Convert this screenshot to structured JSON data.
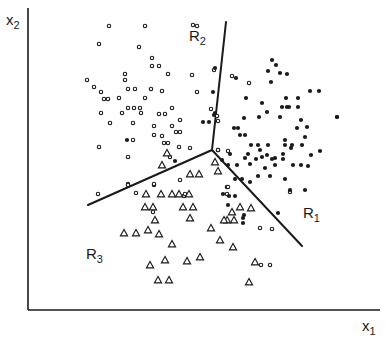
{
  "figure": {
    "y_axis_label": "x",
    "y_axis_sub": "2",
    "x_axis_label": "x",
    "x_axis_sub": "1",
    "regions": [
      {
        "name": "R",
        "sub": "1",
        "x": 303,
        "y": 205
      },
      {
        "name": "R",
        "sub": "2",
        "x": 189,
        "y": 28
      },
      {
        "name": "R",
        "sub": "3",
        "x": 86,
        "y": 246
      }
    ],
    "colors": {
      "ink": "#1a1a1a",
      "background": "#ffffff"
    }
  },
  "chart_data": {
    "type": "scatter",
    "title": "",
    "xlabel": "x1",
    "ylabel": "x2",
    "grid": false,
    "legend": "none",
    "axes_px": {
      "origin": [
        28,
        310
      ],
      "x_end": [
        380,
        310
      ],
      "y_end": [
        28,
        8
      ]
    },
    "boundaries": [
      {
        "name": "R1|R2",
        "from": [
          212,
          150
        ],
        "to": [
          226,
          22
        ]
      },
      {
        "name": "R2|R3",
        "from": [
          212,
          150
        ],
        "to": [
          88,
          205
        ]
      },
      {
        "name": "R1|R3",
        "from": [
          212,
          150
        ],
        "to": [
          302,
          246
        ]
      }
    ],
    "series": [
      {
        "name": "open circles",
        "marker": "open-circle",
        "points": [
          [
            109,
            26
          ],
          [
            145,
            26
          ],
          [
            99,
            44
          ],
          [
            139,
            47
          ],
          [
            152,
            58
          ],
          [
            152,
            66
          ],
          [
            159,
            66
          ],
          [
            125,
            74
          ],
          [
            125,
            80
          ],
          [
            87,
            80
          ],
          [
            94,
            87
          ],
          [
            101,
            92
          ],
          [
            128,
            89
          ],
          [
            135,
            89
          ],
          [
            151,
            89
          ],
          [
            168,
            74
          ],
          [
            104,
            99
          ],
          [
            108,
            99
          ],
          [
            119,
            98
          ],
          [
            162,
            91
          ],
          [
            145,
            98
          ],
          [
            128,
            108
          ],
          [
            134,
            108
          ],
          [
            140,
            108
          ],
          [
            101,
            113
          ],
          [
            122,
            113
          ],
          [
            141,
            113
          ],
          [
            159,
            114
          ],
          [
            165,
            114
          ],
          [
            172,
            108
          ],
          [
            110,
            123
          ],
          [
            133,
            123
          ],
          [
            180,
            120
          ],
          [
            154,
            126
          ],
          [
            172,
            126
          ],
          [
            154,
            135
          ],
          [
            162,
            136
          ],
          [
            176,
            132
          ],
          [
            180,
            132
          ],
          [
            133,
            140
          ],
          [
            164,
            143
          ],
          [
            168,
            143
          ],
          [
            179,
            147
          ],
          [
            190,
            148
          ],
          [
            99,
            147
          ],
          [
            128,
            157
          ],
          [
            193,
            25
          ],
          [
            197,
            26
          ],
          [
            192,
            75
          ],
          [
            197,
            92
          ],
          [
            214,
            70
          ],
          [
            211,
            109
          ],
          [
            217,
            116
          ],
          [
            218,
            121
          ],
          [
            218,
            150
          ],
          [
            249,
            83
          ],
          [
            232,
            76
          ],
          [
            228,
            151
          ],
          [
            218,
            150
          ],
          [
            154,
            185
          ],
          [
            128,
            184
          ],
          [
            136,
            193
          ],
          [
            128,
            185
          ],
          [
            154,
            184
          ],
          [
            98,
            194
          ],
          [
            227,
            187
          ],
          [
            227,
            194
          ],
          [
            228,
            187
          ],
          [
            153,
            212
          ],
          [
            155,
            221
          ],
          [
            184,
            196
          ],
          [
            180,
            180
          ],
          [
            185,
            194
          ],
          [
            170,
            157
          ],
          [
            260,
            228
          ],
          [
            272,
            229
          ],
          [
            261,
            265
          ],
          [
            270,
            265
          ],
          [
            290,
            192
          ]
        ]
      },
      {
        "name": "filled dots",
        "marker": "filled-dot",
        "points": [
          [
            127,
            140
          ],
          [
            175,
            161
          ],
          [
            215,
            68
          ],
          [
            213,
            92
          ],
          [
            215,
            113
          ],
          [
            214,
            115
          ],
          [
            203,
            122
          ],
          [
            209,
            122
          ],
          [
            236,
            78
          ],
          [
            246,
            98
          ],
          [
            268,
            71
          ],
          [
            272,
            60
          ],
          [
            276,
            65
          ],
          [
            271,
            82
          ],
          [
            287,
            74
          ],
          [
            280,
            73
          ],
          [
            310,
            91
          ],
          [
            319,
            91
          ],
          [
            298,
            98
          ],
          [
            286,
            98
          ],
          [
            287,
            107
          ],
          [
            262,
            103
          ],
          [
            267,
            112
          ],
          [
            282,
            107
          ],
          [
            289,
            107
          ],
          [
            298,
            107
          ],
          [
            301,
            120
          ],
          [
            280,
            117
          ],
          [
            297,
            128
          ],
          [
            307,
            127
          ],
          [
            305,
            137
          ],
          [
            285,
            140
          ],
          [
            291,
            148
          ],
          [
            292,
            145
          ],
          [
            302,
            145
          ],
          [
            259,
            117
          ],
          [
            244,
            118
          ],
          [
            234,
            128
          ],
          [
            238,
            128
          ],
          [
            240,
            135
          ],
          [
            245,
            135
          ],
          [
            251,
            145
          ],
          [
            258,
            145
          ],
          [
            268,
            145
          ],
          [
            285,
            145
          ],
          [
            222,
            160
          ],
          [
            230,
            154
          ],
          [
            248,
            154
          ],
          [
            228,
            165
          ],
          [
            237,
            165
          ],
          [
            245,
            158
          ],
          [
            256,
            159
          ],
          [
            262,
            157
          ],
          [
            272,
            159
          ],
          [
            283,
            154
          ],
          [
            267,
            155
          ],
          [
            275,
            158
          ],
          [
            301,
            165
          ],
          [
            250,
            164
          ],
          [
            258,
            176
          ],
          [
            265,
            168
          ],
          [
            270,
            176
          ],
          [
            283,
            159
          ],
          [
            293,
            165
          ],
          [
            275,
            165
          ],
          [
            311,
            155
          ],
          [
            308,
            166
          ],
          [
            235,
            179
          ],
          [
            242,
            179
          ],
          [
            250,
            182
          ],
          [
            285,
            179
          ],
          [
            290,
            190
          ],
          [
            305,
            190
          ],
          [
            337,
            117
          ],
          [
            320,
            151
          ],
          [
            260,
            150
          ],
          [
            235,
            196
          ],
          [
            228,
            205
          ],
          [
            243,
            218
          ],
          [
            278,
            213
          ],
          [
            229,
            196
          ],
          [
            243,
            223
          ],
          [
            337,
            117
          ],
          [
            244,
            215
          ],
          [
            223,
            194
          ]
        ]
      },
      {
        "name": "triangles",
        "marker": "open-triangle",
        "points": [
          [
            167,
            153
          ],
          [
            162,
            165
          ],
          [
            215,
            162
          ],
          [
            218,
            171
          ],
          [
            190,
            174
          ],
          [
            199,
            174
          ],
          [
            146,
            194
          ],
          [
            161,
            194
          ],
          [
            172,
            194
          ],
          [
            179,
            194
          ],
          [
            189,
            194
          ],
          [
            145,
            207
          ],
          [
            153,
            207
          ],
          [
            183,
            207
          ],
          [
            193,
            207
          ],
          [
            190,
            218
          ],
          [
            155,
            220
          ],
          [
            124,
            233
          ],
          [
            136,
            233
          ],
          [
            148,
            230
          ],
          [
            159,
            234
          ],
          [
            172,
            244
          ],
          [
            240,
            207
          ],
          [
            251,
            208
          ],
          [
            227,
            220
          ],
          [
            234,
            220
          ],
          [
            165,
            260
          ],
          [
            220,
            240
          ],
          [
            200,
            257
          ],
          [
            249,
            282
          ],
          [
            150,
            265
          ],
          [
            187,
            261
          ],
          [
            158,
            280
          ],
          [
            169,
            280
          ],
          [
            211,
            228
          ],
          [
            232,
            212
          ],
          [
            233,
            247
          ],
          [
            224,
            220
          ],
          [
            255,
            262
          ]
        ]
      }
    ]
  }
}
